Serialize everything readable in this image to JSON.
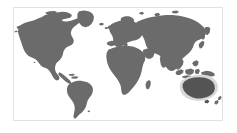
{
  "widget": {
    "type": "world-map-thumbnail",
    "caption": "",
    "background_color": "#ffffff",
    "border_color": "#e2e2e2"
  },
  "map": {
    "projection": "equirectangular",
    "land_color": "#6b6b6b",
    "ocean_color": "#ffffff",
    "highlight_color": "#545454",
    "halo_color": "#d8d8d8",
    "highlighted_region": "Australia",
    "regions": [
      {
        "name": "North America",
        "highlighted": false
      },
      {
        "name": "South America",
        "highlighted": false
      },
      {
        "name": "Greenland",
        "highlighted": false
      },
      {
        "name": "Europe",
        "highlighted": false
      },
      {
        "name": "Africa",
        "highlighted": false
      },
      {
        "name": "Asia",
        "highlighted": false
      },
      {
        "name": "Australia",
        "highlighted": true
      },
      {
        "name": "New Zealand",
        "highlighted": false
      },
      {
        "name": "Indonesia",
        "highlighted": false
      },
      {
        "name": "Japan",
        "highlighted": false
      },
      {
        "name": "British Isles",
        "highlighted": false
      },
      {
        "name": "Madagascar",
        "highlighted": false
      }
    ]
  }
}
